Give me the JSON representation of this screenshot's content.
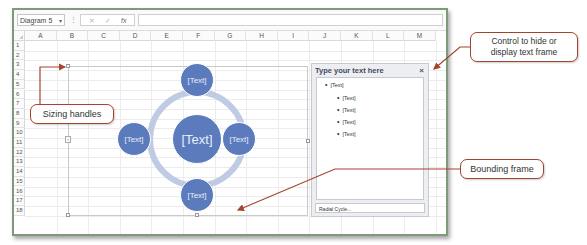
{
  "formula_bar": {
    "name_box": "Diagram 5",
    "name_box_dropdown": "▾",
    "separator": "⋮",
    "cancel_icon": "✕",
    "enter_icon": "✓",
    "fx_icon": "fx",
    "formula_value": ""
  },
  "sheet": {
    "columns": [
      "A",
      "B",
      "C",
      "D",
      "E",
      "F",
      "G",
      "H",
      "I",
      "J",
      "K",
      "L",
      "M"
    ],
    "rows": [
      "1",
      "2",
      "3",
      "4",
      "5",
      "6",
      "7",
      "8",
      "9",
      "10",
      "11",
      "12",
      "13",
      "14",
      "15",
      "16",
      "17",
      "18"
    ]
  },
  "smartart": {
    "layout": "Radial Cycle",
    "center_node": "[Text]",
    "nodes": {
      "top": "[Text]",
      "left": "[Text]",
      "right": "[Text]",
      "bottom": "[Text]"
    },
    "fill_color": "#5b7bbd",
    "ring_color": "#bfcbe3"
  },
  "text_pane": {
    "title": "Type your text here",
    "close_icon": "×",
    "bullets": [
      {
        "level": 1,
        "text": "[Text]"
      },
      {
        "level": 2,
        "text": "[Text]"
      },
      {
        "level": 2,
        "text": "[Text]"
      },
      {
        "level": 2,
        "text": "[Text]"
      },
      {
        "level": 2,
        "text": "[Text]"
      }
    ],
    "footer": "Radial Cycle..."
  },
  "callouts": {
    "sizing_handles": "Sizing handles",
    "control_text_frame_line1": "Control to hide or",
    "control_text_frame_line2": "display text frame",
    "bounding_frame": "Bounding frame",
    "accent_color": "#a5432e"
  }
}
